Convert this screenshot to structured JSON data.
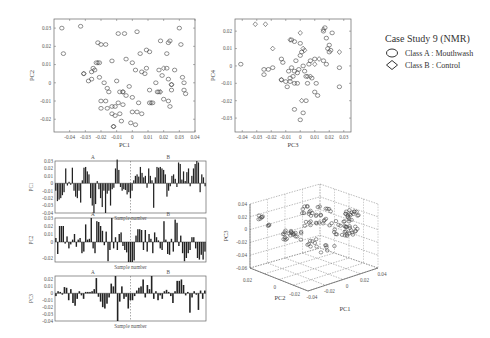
{
  "legend": {
    "title": "Case Study 9 (NMR)",
    "items": [
      {
        "marker": "circle",
        "label": "Class A : Mouthwash"
      },
      {
        "marker": "diamond",
        "label": "Class B : Control"
      }
    ]
  },
  "chart_data": [
    {
      "type": "scatter",
      "title": "",
      "xlabel": "PC1",
      "ylabel": "PC2",
      "xlim": [
        -0.05,
        0.04
      ],
      "ylim": [
        -0.027,
        0.035
      ],
      "xticks": [
        "-0.04",
        "-0.03",
        "-0.02",
        "-0.01",
        "0",
        "0.01",
        "0.02",
        "0.03",
        "0.04"
      ],
      "yticks": [
        "-0.02",
        "-0.01",
        "0",
        "0.01",
        "0.02",
        "0.03"
      ],
      "series": [
        {
          "name": "Class A : Mouthwash",
          "marker": "circle",
          "points": [
            [
              -0.045,
              0.03
            ],
            [
              -0.033,
              0.031
            ],
            [
              -0.044,
              0.016
            ],
            [
              -0.022,
              0.022
            ],
            [
              -0.02,
              0.021
            ],
            [
              -0.017,
              0.021
            ],
            [
              -0.009,
              0.027
            ],
            [
              -0.005,
              0.027
            ],
            [
              0.003,
              0.028
            ],
            [
              -0.023,
              0.011
            ],
            [
              -0.021,
              0.011
            ],
            [
              -0.025,
              0.008
            ],
            [
              -0.026,
              0.006
            ],
            [
              -0.024,
              0.007
            ],
            [
              -0.031,
              0.005
            ],
            [
              -0.028,
              0.001
            ],
            [
              -0.026,
              0.002
            ],
            [
              -0.021,
              0.003
            ],
            [
              -0.018,
              0.0
            ],
            [
              -0.016,
              -0.003
            ],
            [
              -0.015,
              -0.005
            ],
            [
              -0.013,
              0.012
            ],
            [
              -0.01,
              0.001
            ],
            [
              -0.008,
              -0.005
            ],
            [
              -0.006,
              -0.005
            ],
            [
              -0.004,
              -0.007
            ],
            [
              -0.002,
              -0.002
            ],
            [
              0.0,
              -0.008
            ],
            [
              -0.02,
              -0.01
            ],
            [
              -0.017,
              -0.01
            ],
            [
              -0.02,
              -0.014
            ],
            [
              -0.016,
              -0.014
            ],
            [
              -0.013,
              -0.013
            ],
            [
              -0.011,
              -0.013
            ],
            [
              -0.009,
              -0.011
            ],
            [
              -0.006,
              -0.012
            ],
            [
              -0.013,
              -0.017
            ],
            [
              -0.011,
              -0.018
            ],
            [
              -0.008,
              -0.017
            ],
            [
              -0.012,
              -0.024
            ],
            [
              -0.007,
              -0.021
            ],
            [
              -0.001,
              -0.022
            ],
            [
              0.002,
              -0.023
            ],
            [
              0.003,
              -0.016
            ],
            [
              0.006,
              -0.017
            ],
            [
              0.004,
              -0.011
            ],
            [
              0.0,
              -0.016
            ],
            [
              -0.004,
              0.013
            ],
            [
              0.0,
              0.011
            ],
            [
              0.002,
              0.007
            ],
            [
              0.005,
              0.016
            ],
            [
              0.009,
              0.018
            ],
            [
              0.011,
              0.017
            ],
            [
              0.009,
              0.008
            ],
            [
              0.008,
              0.005
            ],
            [
              0.006,
              0.006
            ],
            [
              0.011,
              -0.004
            ],
            [
              0.011,
              -0.011
            ],
            [
              0.013,
              -0.011
            ],
            [
              0.016,
              -0.005
            ],
            [
              0.017,
              0.007
            ],
            [
              0.019,
              0.004
            ],
            [
              0.02,
              -0.009
            ],
            [
              0.023,
              -0.01
            ],
            [
              0.024,
              -0.013
            ],
            [
              0.025,
              -0.004
            ],
            [
              0.022,
              0.008
            ],
            [
              0.023,
              0.002
            ],
            [
              0.025,
              -0.001
            ],
            [
              0.027,
              0.007
            ],
            [
              0.03,
              0.03
            ],
            [
              0.031,
              0.021
            ],
            [
              0.022,
              0.016
            ],
            [
              0.032,
              0.003
            ],
            [
              0.033,
              -0.004
            ],
            [
              0.034,
              -0.006
            ],
            [
              0.033,
              0.0
            ],
            [
              0.018,
              0.023
            ],
            [
              0.023,
              0.022
            ],
            [
              0.024,
              0.023
            ],
            [
              0.015,
              0.0
            ],
            [
              0.017,
              -0.005
            ]
          ]
        },
        {
          "name": "Class B : Control",
          "marker": "diamond",
          "points": [
            [
              -0.031,
              0.005
            ],
            [
              -0.022,
              0.011
            ],
            [
              -0.006,
              -0.005
            ],
            [
              0.012,
              -0.011
            ],
            [
              0.018,
              -0.005
            ],
            [
              0.025,
              -0.001
            ],
            [
              0.02,
              0.008
            ],
            [
              -0.012,
              -0.024
            ]
          ]
        }
      ]
    },
    {
      "type": "scatter",
      "xlabel": "PC3",
      "ylabel": "PC4",
      "xlim": [
        -0.045,
        0.035
      ],
      "ylim": [
        -0.038,
        0.027
      ],
      "xticks": [
        "-0.04",
        "-0.03",
        "-0.02",
        "-0.01",
        "0",
        "0.01",
        "0.02",
        "0.03"
      ],
      "yticks": [
        "-0.03",
        "-0.02",
        "-0.01",
        "0",
        "0.01",
        "0.02"
      ],
      "series": [
        {
          "name": "Class A : Mouthwash",
          "marker": "circle",
          "points": [
            [
              -0.041,
              0.001
            ],
            [
              -0.025,
              -0.002
            ],
            [
              -0.025,
              -0.005
            ],
            [
              -0.022,
              -0.002
            ],
            [
              -0.019,
              -0.001
            ],
            [
              -0.013,
              0.004
            ],
            [
              -0.012,
              0.002
            ],
            [
              -0.013,
              -0.008
            ],
            [
              -0.01,
              -0.009
            ],
            [
              -0.008,
              -0.003
            ],
            [
              -0.009,
              -0.012
            ],
            [
              -0.007,
              -0.009
            ],
            [
              -0.005,
              -0.006
            ],
            [
              -0.006,
              -0.001
            ],
            [
              -0.004,
              -0.003
            ],
            [
              -0.003,
              0.003
            ],
            [
              -0.002,
              -0.004
            ],
            [
              -0.001,
              -0.002
            ],
            [
              0.0,
              0.006
            ],
            [
              0.001,
              0.008
            ],
            [
              0.002,
              0.0
            ],
            [
              0.003,
              -0.003
            ],
            [
              0.004,
              -0.006
            ],
            [
              0.005,
              -0.01
            ],
            [
              0.006,
              0.001
            ],
            [
              0.007,
              0.003
            ],
            [
              0.008,
              -0.007
            ],
            [
              0.01,
              0.004
            ],
            [
              0.011,
              -0.01
            ],
            [
              0.01,
              -0.015
            ],
            [
              0.012,
              -0.017
            ],
            [
              0.016,
              0.02
            ],
            [
              0.018,
              0.016
            ],
            [
              0.02,
              0.012
            ],
            [
              0.021,
              0.009
            ],
            [
              0.017,
              0.022
            ],
            [
              0.022,
              0.019
            ],
            [
              0.019,
              0.01
            ],
            [
              0.02,
              0.008
            ],
            [
              0.027,
              -0.001
            ],
            [
              0.027,
              -0.012
            ],
            [
              0.016,
              0.003
            ],
            [
              0.018,
              0.001
            ],
            [
              -0.004,
              -0.025
            ],
            [
              0.002,
              -0.027
            ],
            [
              0.0,
              -0.031
            ],
            [
              0.004,
              -0.02
            ],
            [
              -0.006,
              0.015
            ],
            [
              -0.004,
              0.014
            ],
            [
              0.0,
              0.013
            ],
            [
              -0.002,
              -0.01
            ],
            [
              -0.004,
              -0.01
            ],
            [
              -0.007,
              -0.007
            ]
          ]
        },
        {
          "name": "Class B : Control",
          "marker": "diamond",
          "points": [
            [
              -0.031,
              0.024
            ],
            [
              -0.024,
              0.024
            ],
            [
              -0.019,
              0.01
            ],
            [
              -0.007,
              0.015
            ],
            [
              0.0,
              0.019
            ],
            [
              0.002,
              0.01
            ],
            [
              0.003,
              0.009
            ],
            [
              0.005,
              -0.006
            ],
            [
              0.007,
              -0.006
            ],
            [
              0.013,
              0.004
            ],
            [
              0.01,
              0.001
            ],
            [
              0.027,
              0.008
            ],
            [
              0.016,
              0.021
            ],
            [
              -0.013,
              -0.008
            ],
            [
              0.001,
              -0.02
            ]
          ]
        }
      ]
    },
    {
      "type": "bar",
      "ylabel": "PC1",
      "xlabel": "Sample number",
      "group_labels": [
        "A",
        "B"
      ],
      "ylim": [
        -0.04,
        0.03
      ],
      "yticks": [
        "0.03",
        "0.02",
        "0.01",
        "0",
        "-0.01",
        "-0.02",
        "-0.03",
        "-0.04"
      ],
      "values": [
        -0.01,
        -0.024,
        -0.022,
        -0.02,
        -0.016,
        -0.012,
        0.02,
        -0.003,
        0.002,
        -0.002,
        0.021,
        -0.01,
        -0.018,
        -0.02,
        -0.01,
        -0.026,
        0.004,
        0.021,
        0.022,
        0.016,
        0.012,
        -0.02,
        -0.03,
        -0.04,
        -0.028,
        0.003,
        -0.008,
        -0.02,
        -0.032,
        -0.01,
        -0.04,
        -0.014,
        -0.01,
        -0.03,
        -0.008,
        -0.006,
        0.02,
        0.032,
        0.018,
        -0.005,
        -0.01,
        -0.008,
        -0.009,
        -0.015,
        -0.012,
        -0.02,
        -0.01,
        0.004,
        0.01,
        0.012,
        0.009,
        0.022,
        0.014,
        0.008,
        0.01,
        -0.006,
        0.02,
        0.01,
        0.004,
        -0.033,
        0.008,
        0.022,
        0.021,
        0.022,
        0.02,
        0.018,
        0.012,
        -0.018,
        -0.01,
        -0.004,
        0.01,
        0.012,
        0.006,
        -0.005,
        0.028,
        0.026,
        0.005,
        0.016,
        0.003,
        0.015,
        0.02,
        -0.004,
        0.01,
        0.02,
        0.026,
        0.03,
        0.028,
        -0.012,
        0.012,
        0.008,
        -0.004
      ]
    },
    {
      "type": "bar",
      "ylabel": "PC2",
      "xlabel": "Sample number",
      "group_labels": [
        "A",
        "B"
      ],
      "ylim": [
        -0.025,
        0.03
      ],
      "yticks": [
        "0.03",
        "0.02",
        "0.01",
        "0",
        "-0.02"
      ],
      "values": [
        0.005,
        -0.015,
        0.02,
        0.02,
        0.02,
        -0.002,
        0.007,
        -0.008,
        -0.003,
        0.003,
        0.01,
        -0.006,
        0.003,
        0.005,
        -0.014,
        -0.012,
        0.022,
        0.003,
        0.004,
        0.03,
        -0.008,
        -0.014,
        0.026,
        0.025,
        0.02,
        0.014,
        -0.004,
        0.013,
        -0.024,
        -0.01,
        0.03,
        -0.008,
        0.006,
        -0.01,
        0.01,
        0.012,
        -0.005,
        -0.01,
        -0.013,
        -0.025,
        -0.025,
        -0.025,
        -0.023,
        0.008,
        0.016,
        0.016,
        0.015,
        -0.01,
        0.015,
        -0.012,
        0.01,
        0.004,
        -0.014,
        0.012,
        0.006,
        0.002,
        -0.008,
        -0.01,
        0.026,
        0.003,
        -0.015,
        -0.016,
        0.004,
        -0.012,
        0.028,
        0.024,
        -0.005,
        0.008,
        -0.014,
        -0.024,
        -0.02,
        -0.014,
        -0.01,
        0.006,
        0.006,
        -0.008,
        -0.02,
        -0.022,
        -0.016,
        -0.022,
        -0.012
      ]
    },
    {
      "type": "bar",
      "ylabel": "PC3",
      "xlabel": "Sample number",
      "group_labels": [
        "A",
        "B"
      ],
      "ylim": [
        -0.04,
        0.025
      ],
      "yticks": [
        "0.02",
        "0.01",
        "0",
        "-0.01",
        "-0.02",
        "-0.03",
        "-0.04"
      ],
      "values": [
        -0.004,
        0.003,
        0.002,
        -0.002,
        0.009,
        0.008,
        -0.01,
        0.006,
        -0.014,
        -0.018,
        -0.008,
        0.003,
        -0.003,
        -0.008,
        0.002,
        0.002,
        0.002,
        0.003,
        0.006,
        0.022,
        -0.005,
        -0.012,
        -0.02,
        -0.022,
        -0.015,
        -0.006,
        0.014,
        0.01,
        0.025,
        -0.04,
        -0.012,
        0.01,
        -0.008,
        -0.005,
        -0.022,
        -0.01,
        -0.01,
        -0.004,
        0.004,
        0.008,
        0.01,
        0.02,
        -0.006,
        0.012,
        0.006,
        0.025,
        -0.008,
        0.003,
        -0.01,
        -0.003,
        -0.008,
        0.003,
        0.005,
        0.002,
        -0.004,
        -0.014,
        0.003,
        0.018,
        0.018,
        0.02,
        0.012,
        -0.003,
        0.002,
        -0.028,
        -0.006,
        0.003,
        -0.002,
        -0.024,
        0.004,
        -0.008,
        0.004
      ]
    },
    {
      "type": "scatter3d",
      "xlabel": "PC1",
      "ylabel": "PC2",
      "zlabel": "PC3",
      "xticks": [
        "-0.04",
        "-0.02",
        "0",
        "0.02",
        "0.04"
      ],
      "yticks": [
        "-0.02",
        "0",
        "0.02"
      ],
      "zticks": [
        "0.04",
        "0.02",
        "0",
        "-0.02",
        "-0.04",
        "-0.06"
      ]
    }
  ]
}
